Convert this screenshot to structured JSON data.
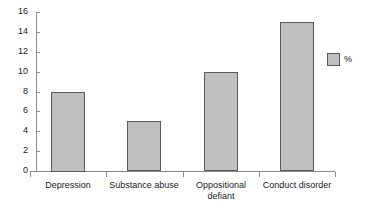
{
  "chart_data": {
    "type": "bar",
    "title": "",
    "subtitle": "",
    "xlabel": "",
    "ylabel": "",
    "categories": [
      "Depression",
      "Substance abuse",
      "Oppositional\ndefiant",
      "Conduct disorder"
    ],
    "values": [
      8,
      5,
      10,
      15
    ],
    "series": [
      {
        "name": "%",
        "values": [
          8,
          5,
          10,
          15
        ]
      }
    ],
    "ylim": [
      0,
      16
    ],
    "yticks": [
      0,
      2,
      4,
      6,
      8,
      10,
      12,
      14,
      16
    ],
    "ytick_labels": [
      "0",
      "2",
      "4",
      "6",
      "8",
      "10",
      "12",
      "14",
      "16"
    ],
    "grid": false,
    "legend": {
      "position": "right",
      "entries": [
        {
          "label": "%",
          "color": "#bfbfbf"
        }
      ]
    },
    "colors": {
      "bar_fill": "#bfbfbf",
      "bar_border": "#5a5a5a",
      "axis": "#8a8a8a",
      "text": "#1a1a1a",
      "background": "#ffffff"
    }
  }
}
